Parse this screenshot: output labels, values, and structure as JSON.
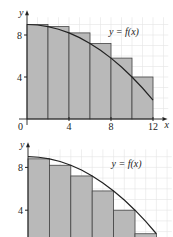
{
  "chart_data": [
    {
      "type": "bar",
      "title": "",
      "description": "Left-endpoint rectangles under y = f(x)",
      "curve_label": "y = f(x)",
      "xlabel": "x",
      "ylabel": "y",
      "xlim": [
        0,
        12.5
      ],
      "ylim": [
        0,
        9.5
      ],
      "x_ticks": [
        "0",
        "4",
        "8",
        "12"
      ],
      "x_tick_values": [
        0,
        4,
        8,
        12
      ],
      "y_ticks": [
        "4",
        "8"
      ],
      "y_tick_values": [
        4,
        8
      ],
      "grid": true,
      "bars": [
        {
          "x0": 0,
          "x1": 2,
          "height": 9.0
        },
        {
          "x0": 2,
          "x1": 4,
          "height": 8.8
        },
        {
          "x0": 4,
          "x1": 6,
          "height": 8.2
        },
        {
          "x0": 6,
          "x1": 8,
          "height": 7.2
        },
        {
          "x0": 8,
          "x1": 10,
          "height": 5.8
        },
        {
          "x0": 10,
          "x1": 12,
          "height": 4.0
        }
      ],
      "curve": {
        "x": [
          0,
          1,
          2,
          3,
          4,
          5,
          6,
          7,
          8,
          9,
          10,
          11,
          12
        ],
        "y": [
          9,
          8.95,
          8.8,
          8.55,
          8.2,
          7.75,
          7.2,
          6.55,
          5.8,
          4.95,
          4.0,
          2.95,
          1.8
        ]
      }
    },
    {
      "type": "bar",
      "title": "",
      "description": "Right-endpoint rectangles under y = f(x)",
      "curve_label": "y = f(x)",
      "xlabel": "x",
      "ylabel": "y",
      "xlim": [
        0,
        12.5
      ],
      "ylim": [
        0,
        9.5
      ],
      "y_ticks": [
        "4",
        "8"
      ],
      "y_tick_values": [
        4,
        8
      ],
      "grid": true,
      "bars": [
        {
          "x0": 0,
          "x1": 2,
          "height": 8.8
        },
        {
          "x0": 2,
          "x1": 4,
          "height": 8.2
        },
        {
          "x0": 4,
          "x1": 6,
          "height": 7.2
        },
        {
          "x0": 6,
          "x1": 8,
          "height": 5.8
        },
        {
          "x0": 8,
          "x1": 10,
          "height": 4.0
        },
        {
          "x0": 10,
          "x1": 12,
          "height": 1.8
        }
      ],
      "curve": {
        "x": [
          0,
          1,
          2,
          3,
          4,
          5,
          6,
          7,
          8,
          9,
          10,
          11,
          12
        ],
        "y": [
          9,
          8.95,
          8.8,
          8.55,
          8.2,
          7.75,
          7.2,
          6.55,
          5.8,
          4.95,
          4.0,
          2.95,
          1.8
        ]
      }
    }
  ]
}
